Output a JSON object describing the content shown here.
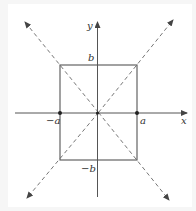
{
  "diagram": {
    "type": "hyperbola-asymptote-box",
    "colors": {
      "line": "#555555",
      "dashed": "#777777",
      "text": "#333333",
      "background": "#ffffff"
    },
    "axes": {
      "x_label": "x",
      "y_label": "y"
    },
    "labels": {
      "b_top": "b",
      "b_bottom": "−b",
      "a_left": "−a",
      "a_right": "a"
    },
    "points": [
      {
        "name": "vertex-left",
        "label": "−a"
      },
      {
        "name": "vertex-right",
        "label": "a"
      },
      {
        "name": "origin",
        "label": ""
      }
    ],
    "rectangle": {
      "corners": [
        "(-a, b)",
        "(a, b)",
        "(a, -b)",
        "(-a, -b)"
      ]
    },
    "asymptotes": [
      {
        "name": "y = (b/a)x",
        "style": "dashed"
      },
      {
        "name": "y = -(b/a)x",
        "style": "dashed"
      }
    ]
  }
}
